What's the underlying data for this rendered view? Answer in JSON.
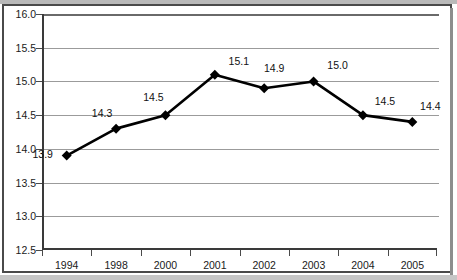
{
  "chart_data": {
    "type": "line",
    "title": "",
    "subtitle": "",
    "xlabel": "",
    "ylabel": "",
    "categories": [
      "1994",
      "1998",
      "2000",
      "2001",
      "2002",
      "2003",
      "2004",
      "2005"
    ],
    "values": [
      13.9,
      14.3,
      14.5,
      15.1,
      14.9,
      15.0,
      14.5,
      14.4
    ],
    "point_labels": [
      "13.9",
      "14.3",
      "14.5",
      "15.1",
      "14.9",
      "15.0",
      "14.5",
      "14.4"
    ],
    "ylim": [
      12.5,
      16.0
    ],
    "ytick_step": 0.5,
    "ytick_labels": [
      "16.0",
      "15.5",
      "15.0",
      "14.5",
      "14.0",
      "13.5",
      "13.0",
      "12.5"
    ],
    "ytick_values": [
      16.0,
      15.5,
      15.0,
      14.5,
      14.0,
      13.5,
      13.0,
      12.5
    ],
    "grid": "horizontal",
    "legend": "none",
    "marker": "diamond",
    "line_color": "#000000",
    "marker_color": "#000000",
    "grid_color": "#9b9b9b",
    "axis_color": "#3a3a3a",
    "plot_background": "#ffffff",
    "page_background": "#ffffff",
    "frame_color": "#4a4a4a",
    "band_color": "#b9b9b9"
  }
}
